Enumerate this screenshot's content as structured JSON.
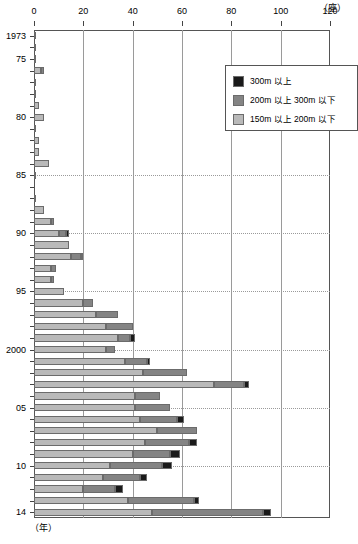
{
  "chart_data": {
    "type": "bar",
    "orientation": "horizontal",
    "stacked": true,
    "title": "",
    "xlabel": "(座)",
    "ylabel": "(年)",
    "xlim": [
      0,
      120
    ],
    "xticks": [
      0,
      20,
      40,
      60,
      80,
      100,
      120
    ],
    "xticklabels": [
      "0",
      "20",
      "40",
      "60",
      "80",
      "100",
      "120"
    ],
    "grid": "vertical gridlines at every x tick; dotted horizontal gridlines at 1985, 1990, 1995, 2000, 2005, 2010",
    "legend_position": "top-right inside plot",
    "categories": [
      "1973",
      "1974",
      "1975",
      "1976",
      "1977",
      "1978",
      "1979",
      "1980",
      "1981",
      "1982",
      "1983",
      "1984",
      "1985",
      "1986",
      "1987",
      "1988",
      "1989",
      "1990",
      "1991",
      "1992",
      "1993",
      "1994",
      "1995",
      "1996",
      "1997",
      "1998",
      "1999",
      "2000",
      "2001",
      "2002",
      "2003",
      "2004",
      "2005",
      "2006",
      "2007",
      "2008",
      "2009",
      "2010",
      "2011",
      "2012",
      "2013",
      "2014"
    ],
    "categories_shown": [
      "1973",
      "75",
      "80",
      "85",
      "90",
      "95",
      "2000",
      "05",
      "10",
      "14"
    ],
    "series": [
      {
        "name": "150m 以上 200m 以下",
        "color": "#b9b9b9",
        "values": [
          1,
          1,
          1,
          3,
          1,
          1,
          2,
          4,
          1,
          2,
          2,
          6,
          1,
          0,
          1,
          4,
          7,
          10,
          14,
          15,
          7,
          7,
          12,
          20,
          25,
          29,
          34,
          29,
          37,
          44,
          73,
          41,
          41,
          43,
          50,
          45,
          40,
          31,
          28,
          20,
          38,
          48
        ]
      },
      {
        "name": "200m 以上 300m 以下",
        "color": "#848484",
        "values": [
          0,
          0,
          0,
          1,
          0,
          0,
          0,
          0,
          0,
          0,
          0,
          0,
          0,
          0,
          0,
          0,
          1,
          3,
          0,
          4,
          2,
          1,
          0,
          4,
          9,
          11,
          5,
          4,
          9,
          18,
          12,
          10,
          14,
          15,
          16,
          18,
          15,
          21,
          15,
          13,
          27,
          45
        ]
      },
      {
        "name": "300m 以上",
        "color": "#1a1a1a",
        "values": [
          0,
          0,
          0,
          0,
          0,
          0,
          0,
          0,
          0,
          0,
          0,
          0,
          0,
          0,
          0,
          0,
          0,
          1,
          0,
          1,
          0,
          0,
          0,
          0,
          0,
          0,
          2,
          0,
          1,
          0,
          2,
          0,
          0,
          3,
          0,
          3,
          4,
          4,
          3,
          3,
          2,
          3
        ]
      }
    ],
    "totals": [
      1,
      1,
      1,
      4,
      1,
      1,
      2,
      4,
      1,
      2,
      2,
      6,
      1,
      0,
      1,
      4,
      8,
      14,
      14,
      20,
      9,
      8,
      12,
      24,
      34,
      40,
      41,
      33,
      47,
      62,
      87,
      51,
      55,
      61,
      66,
      66,
      59,
      56,
      46,
      36,
      67,
      96
    ]
  },
  "legend": {
    "items": [
      {
        "label": "300m 以上",
        "color": "#1a1a1a"
      },
      {
        "label": "200m 以上 300m 以下",
        "color": "#848484"
      },
      {
        "label": "150m 以上 200m 以下",
        "color": "#b9b9b9"
      }
    ]
  },
  "axis": {
    "unit_top": "（座）",
    "unit_bottom": "（年）"
  }
}
